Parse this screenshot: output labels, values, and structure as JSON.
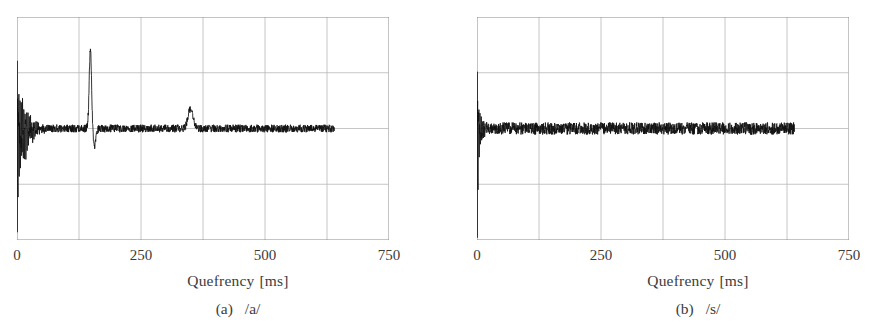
{
  "figure": {
    "type": "two-panel-figure",
    "background_color": "#ffffff",
    "trace_color": "#111111",
    "grid_color": "#b8b8b8",
    "frame_color": "#8a8a8a",
    "text_color": "#3c3c3c"
  },
  "axis": {
    "xlabel_text": "Quefrency",
    "xlabel_unit": "[ms]",
    "ticks": [
      "0",
      "250",
      "500",
      "750"
    ],
    "tick_values": [
      0,
      250,
      500,
      750
    ]
  },
  "panels": [
    {
      "id": "a",
      "caption_index": "(a)",
      "caption_phoneme": "/a/",
      "ticks": [
        "0",
        "250",
        "500",
        "750"
      ]
    },
    {
      "id": "b",
      "caption_index": "(b)",
      "caption_phoneme": "/s/",
      "ticks": [
        "0",
        "250",
        "500",
        "750"
      ]
    }
  ],
  "chart_data": [
    {
      "type": "line",
      "id": "panel-a",
      "title": "(a)  /a/",
      "xlabel": "Quefrency [ms]",
      "ylabel": "",
      "xlim": [
        0,
        750
      ],
      "ylim": [
        -1,
        1
      ],
      "xticks": [
        0,
        250,
        500,
        750
      ],
      "grid": true,
      "grid_x_step": 125,
      "grid_y_divisions": 4,
      "legend": "none",
      "data_extent_ms": [
        0,
        640
      ],
      "baseline": 0,
      "annotations": [
        {
          "label": "DC / low-quefrency burst",
          "x_ms": 0,
          "amplitude": 1.0
        },
        {
          "label": "rahmonic pitch peak",
          "x_ms": 148,
          "amplitude": 0.72
        },
        {
          "label": "secondary rahmonic",
          "x_ms": 350,
          "amplitude": 0.18
        }
      ],
      "features": {
        "burst_x_ms": 0,
        "burst_decay_ms": 26,
        "burst_amp_up": 0.62,
        "burst_amp_down": 0.95,
        "pitch_peak_x_ms": 148,
        "pitch_peak_amp": 0.72,
        "pitch_peak_width_ms": 5,
        "secondary_peak_x_ms": 350,
        "secondary_peak_amp": 0.18,
        "secondary_peak_width_ms": 9,
        "noise_amp": 0.035,
        "seed": 17
      }
    },
    {
      "type": "line",
      "id": "panel-b",
      "title": "(b)  /s/",
      "xlabel": "Quefrency [ms]",
      "ylabel": "",
      "xlim": [
        0,
        750
      ],
      "ylim": [
        -1,
        1
      ],
      "xticks": [
        0,
        250,
        500,
        750
      ],
      "grid": true,
      "grid_x_step": 125,
      "grid_y_divisions": 4,
      "legend": "none",
      "data_extent_ms": [
        0,
        640
      ],
      "baseline": 0,
      "annotations": [
        {
          "label": "DC / low-quefrency spike (unvoiced, no pitch peak)",
          "x_ms": 0,
          "amplitude": 1.0
        }
      ],
      "features": {
        "burst_x_ms": 0,
        "burst_decay_ms": 9,
        "burst_amp_up": 0.52,
        "burst_amp_down": 1.0,
        "pitch_peak_x_ms": null,
        "pitch_peak_amp": 0,
        "pitch_peak_width_ms": 0,
        "secondary_peak_x_ms": null,
        "secondary_peak_amp": 0,
        "secondary_peak_width_ms": 0,
        "noise_amp": 0.055,
        "seed": 91
      }
    }
  ]
}
